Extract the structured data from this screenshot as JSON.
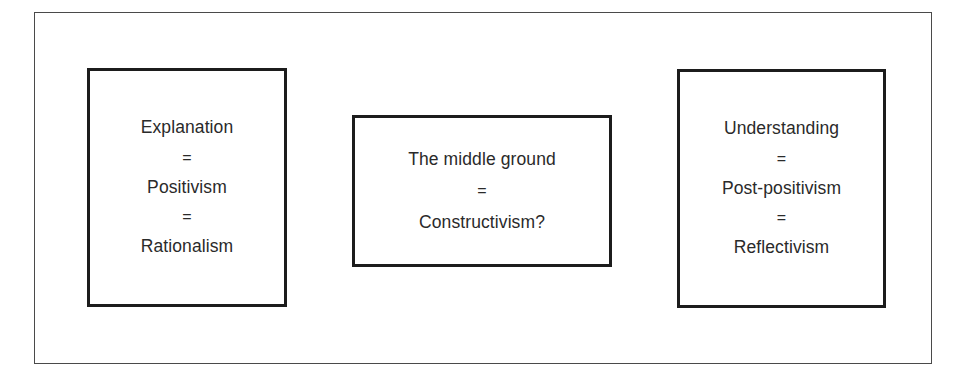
{
  "diagram": {
    "canvas": {
      "width": 959,
      "height": 383,
      "background": "#ffffff"
    },
    "frame": {
      "name": "outer-frame",
      "border_color": "#4a4a4a",
      "border_width": 1
    },
    "box_style": {
      "border_color": "#1c1c1c",
      "border_width": 3,
      "fill": "#ffffff",
      "text_color": "#2a2a2a"
    },
    "equals_symbol": "=",
    "boxes": [
      {
        "id": "explanation",
        "name": "box-explanation",
        "lines": [
          "Explanation",
          "=",
          "Positivism",
          "=",
          "Rationalism"
        ],
        "terms": [
          "Explanation",
          "Positivism",
          "Rationalism"
        ]
      },
      {
        "id": "middle-ground",
        "name": "box-middle-ground",
        "lines": [
          "The middle ground",
          "=",
          "Constructivism?"
        ],
        "terms": [
          "The middle ground",
          "Constructivism?"
        ]
      },
      {
        "id": "understanding",
        "name": "box-understanding",
        "lines": [
          "Understanding",
          "=",
          "Post-positivism",
          "=",
          "Reflectivism"
        ],
        "terms": [
          "Understanding",
          "Post-positivism",
          "Reflectivism"
        ]
      }
    ]
  }
}
